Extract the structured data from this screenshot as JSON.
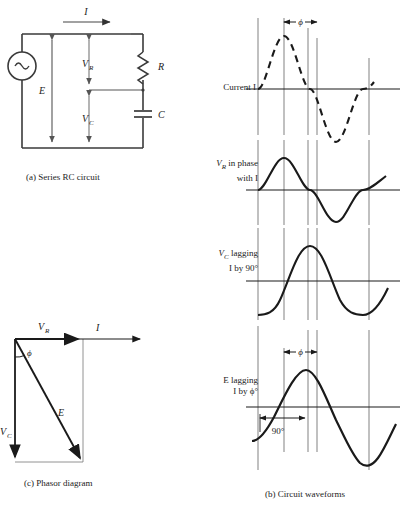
{
  "figure": {
    "title_a": "(a) Series RC circuit",
    "title_b": "(b) Circuit waveforms",
    "title_c": "(c) Phasor diagram"
  },
  "circuit": {
    "source_symbol": "~",
    "current_label": "I",
    "emf_label": "E",
    "vr_label": "V",
    "vr_sub": "R",
    "vc_label": "V",
    "vc_sub": "C",
    "resistor_label": "R",
    "capacitor_label": "C"
  },
  "waveforms": {
    "phi_symbol": "ϕ",
    "angle_90": "90°",
    "rows": [
      {
        "name": "current",
        "line1": "Current I",
        "line2": "",
        "style": "dashed"
      },
      {
        "name": "vr",
        "line1": "V",
        "sub1": "R",
        "line1b": " in phase",
        "line2": "with I",
        "style": "solid"
      },
      {
        "name": "vc",
        "line1": "V",
        "sub1": "C",
        "line1b": " lagging",
        "line2": "I by 90°",
        "style": "solid"
      },
      {
        "name": "e",
        "line1": "E lagging",
        "line2": "I by ϕ°",
        "style": "solid"
      }
    ]
  },
  "phasor": {
    "vr_label": "V",
    "vr_sub": "R",
    "i_label": "I",
    "phi_label": "ϕ",
    "e_label": "E",
    "vc_label": "V",
    "vc_sub": "C"
  },
  "colors": {
    "ink": "#1a1a1a",
    "thin": "#555555",
    "paper": "#ffffff"
  }
}
